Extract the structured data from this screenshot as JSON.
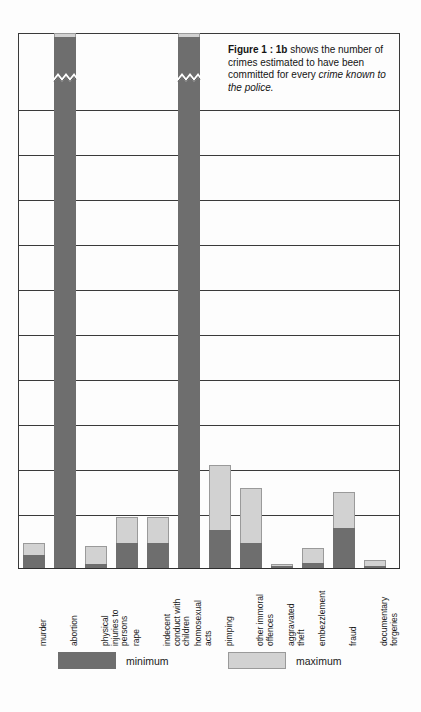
{
  "caption": {
    "figure_label": "Figure 1 : 1b",
    "text_line": " shows the number of crimes estimated to have been committed for every ",
    "emphasis": "crime known to the police."
  },
  "legend": {
    "minimum_label": "minimum",
    "maximum_label": "maximum"
  },
  "colors": {
    "minimum": "#6e6e6e",
    "maximum": "#d2d2d2",
    "gridline": "#3a3a3a",
    "background": "#fdfdfd",
    "text": "#141414"
  },
  "chart_data": {
    "type": "bar",
    "title": "Figure 1 : 1b shows the number of crimes estimated to have been committed for every crime known to the police.",
    "xlabel": "",
    "ylabel": "",
    "stacked": true,
    "grid": true,
    "legend_position": "bottom",
    "ylim": [
      0,
      12
    ],
    "gridline_count": 12,
    "axis_break_note": "Bars for 'abortion' and 'homosexual acts' are drawn with a zigzag axis break; their true values exceed the chart scale.",
    "categories": [
      "murder",
      "abortion",
      "physical\ninjuries to\npersons",
      "rape",
      "indecent\nconduct with\nchildren",
      "homosexual\nacts",
      "pimping",
      "other immoral\noffences",
      "aggravated\ntheft",
      "embezzlement",
      "fraud",
      "documentary\nforgeries"
    ],
    "series": [
      {
        "name": "minimum",
        "values": [
          0.3,
          11.9,
          0.1,
          0.55,
          0.55,
          11.9,
          0.85,
          0.55,
          0.05,
          0.12,
          0.9,
          0.05
        ]
      },
      {
        "name": "maximum",
        "values": [
          0.55,
          12.0,
          0.5,
          1.15,
          1.15,
          12.0,
          2.3,
          1.8,
          0.1,
          0.45,
          1.7,
          0.18
        ]
      }
    ],
    "bars": [
      {
        "category": "murder",
        "minimum": 0.3,
        "maximum": 0.55,
        "broken": false
      },
      {
        "category": "abortion",
        "minimum": 11.9,
        "maximum": 12.0,
        "broken": true
      },
      {
        "category": "physical injuries to persons",
        "minimum": 0.1,
        "maximum": 0.5,
        "broken": false
      },
      {
        "category": "rape",
        "minimum": 0.55,
        "maximum": 1.15,
        "broken": false
      },
      {
        "category": "indecent conduct with children",
        "minimum": 0.55,
        "maximum": 1.15,
        "broken": false
      },
      {
        "category": "homosexual acts",
        "minimum": 11.9,
        "maximum": 12.0,
        "broken": true
      },
      {
        "category": "pimping",
        "minimum": 0.85,
        "maximum": 2.3,
        "broken": false
      },
      {
        "category": "other immoral offences",
        "minimum": 0.55,
        "maximum": 1.8,
        "broken": false
      },
      {
        "category": "aggravated theft",
        "minimum": 0.05,
        "maximum": 0.1,
        "broken": false
      },
      {
        "category": "embezzlement",
        "minimum": 0.12,
        "maximum": 0.45,
        "broken": false
      },
      {
        "category": "fraud",
        "minimum": 0.9,
        "maximum": 1.7,
        "broken": false
      },
      {
        "category": "documentary forgeries",
        "minimum": 0.05,
        "maximum": 0.18,
        "broken": false
      }
    ]
  },
  "geometry": {
    "plot_left": 18,
    "plot_top": 33,
    "plot_width": 382,
    "plot_height": 535,
    "bar_width": 22,
    "bar_pitch": 31.0,
    "first_bar_offset": 5,
    "gridline_y": [
      0,
      77,
      122,
      167,
      212,
      257,
      302,
      347,
      392,
      437,
      482,
      535
    ],
    "unit_px": 44.6
  }
}
